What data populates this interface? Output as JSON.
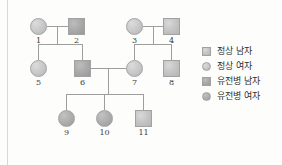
{
  "figure": {
    "type": "pedigree-chart",
    "background_color": "#fdfdfc",
    "line_color": "#9e9e9e",
    "symbol_border_color": "#a2a2a2"
  },
  "legend": {
    "items": [
      {
        "shape": "square",
        "status": "normal",
        "icon": "normal-male-square-icon",
        "label": "정상 남자"
      },
      {
        "shape": "circle",
        "status": "normal",
        "icon": "normal-female-circle-icon",
        "label": "정상 여자"
      },
      {
        "shape": "square",
        "status": "affected",
        "icon": "affected-male-square-icon",
        "label": "유전병 남자"
      },
      {
        "shape": "circle",
        "status": "affected",
        "icon": "affected-female-circle-icon",
        "label": "유전병 여자"
      }
    ]
  },
  "pedigree": {
    "generations": [
      {
        "name": "I",
        "individuals": [
          {
            "id": "1",
            "label": "1",
            "sex": "female",
            "status": "normal",
            "x": 30,
            "y": 18
          },
          {
            "id": "2",
            "label": "2",
            "sex": "male",
            "status": "affected",
            "x": 68,
            "y": 18
          },
          {
            "id": "3",
            "label": "3",
            "sex": "female",
            "status": "normal",
            "x": 126,
            "y": 18
          },
          {
            "id": "4",
            "label": "4",
            "sex": "male",
            "status": "normal",
            "x": 163,
            "y": 18
          }
        ]
      },
      {
        "name": "II",
        "individuals": [
          {
            "id": "5",
            "label": "5",
            "sex": "female",
            "status": "normal",
            "x": 30,
            "y": 60
          },
          {
            "id": "6",
            "label": "6",
            "sex": "male",
            "status": "affected",
            "x": 74,
            "y": 60
          },
          {
            "id": "7",
            "label": "7",
            "sex": "female",
            "status": "normal",
            "x": 126,
            "y": 60
          },
          {
            "id": "8",
            "label": "8",
            "sex": "male",
            "status": "normal",
            "x": 163,
            "y": 60
          }
        ]
      },
      {
        "name": "III",
        "individuals": [
          {
            "id": "9",
            "label": "9",
            "sex": "female",
            "status": "affected",
            "x": 58,
            "y": 110
          },
          {
            "id": "10",
            "label": "10",
            "sex": "female",
            "status": "affected",
            "x": 96,
            "y": 110
          },
          {
            "id": "11",
            "label": "11",
            "sex": "male",
            "status": "normal",
            "x": 135,
            "y": 110
          }
        ]
      }
    ],
    "matings": [
      {
        "id": "mating-1x2",
        "parents": [
          "1",
          "2"
        ],
        "children": [
          "5",
          "6"
        ]
      },
      {
        "id": "mating-3x4",
        "parents": [
          "3",
          "4"
        ],
        "children": [
          "7",
          "8"
        ]
      },
      {
        "id": "mating-6x7",
        "parents": [
          "6",
          "7"
        ],
        "children": [
          "9",
          "10",
          "11"
        ]
      }
    ]
  }
}
